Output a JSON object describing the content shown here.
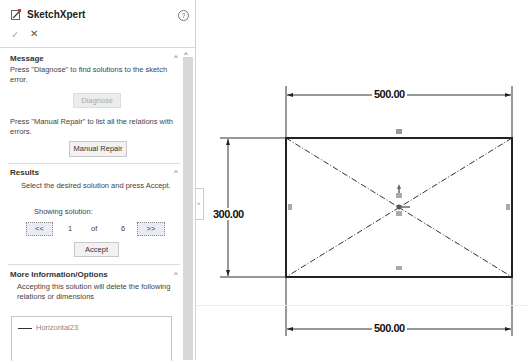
{
  "panel": {
    "title": "SketchXpert",
    "icons": {
      "app": "sketchxpert-icon",
      "help": "help-icon",
      "ok": "checkmark-icon",
      "cancel": "close-icon"
    },
    "help_glyph": "?",
    "ok_glyph": "✓",
    "cancel_glyph": "✕"
  },
  "message": {
    "title": "Message",
    "text1": "Press \"Diagnose\" to find solutions to the sketch error.",
    "diagnose_label": "Diagnose",
    "text2": "Press \"Manual Repair\" to list all the relations with errors.",
    "manual_repair_label": "Manual Repair"
  },
  "results": {
    "title": "Results",
    "instruction": "Select the desired solution and press Accept.",
    "showing_label": "Showing solution:",
    "prev_label": "<<",
    "current": "1",
    "of_label": "of",
    "total": "6",
    "next_label": ">>",
    "accept_label": "Accept"
  },
  "more_info": {
    "title": "More Information/Options",
    "text": "Accepting this solution will delete the following relations or dimensions",
    "items": [
      {
        "label": "Horizontal23",
        "icon": "horizontal-relation-icon"
      }
    ]
  },
  "caret_glyph": "^",
  "collapse_glyph": "»",
  "sketch": {
    "dim_top": "500.00",
    "dim_bottom": "500.00",
    "dim_left": "300.00"
  }
}
